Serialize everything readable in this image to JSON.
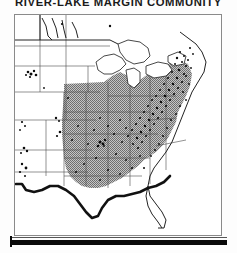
{
  "figure": {
    "title": "RIVER-LAKE MARGIN COMMUNITY",
    "kind": "species-distribution-map",
    "region": "United States",
    "colors": {
      "range_shading": "#a2a2a2",
      "occurrence_dots": "#0b0b0b",
      "state_boundary": "#4a4a4a",
      "coastline": "#111111",
      "lake_fill": "#ffffff",
      "frame": "#8a8a8a",
      "background": "#ffffff"
    },
    "map_elements": {
      "shaded_range_label": "continuous range shading",
      "dot_label": "occurrence records",
      "lakes_label": "Great Lakes",
      "frame_label": "map border",
      "bottom_bar_label": "figure rule"
    },
    "unshaded_areas": [
      "Florida",
      "Texas",
      "Great Lakes",
      "Western states"
    ],
    "shaded_areas": [
      "Midwest",
      "Ohio Valley",
      "Mid-Atlantic",
      "Southeast",
      "New England"
    ]
  }
}
